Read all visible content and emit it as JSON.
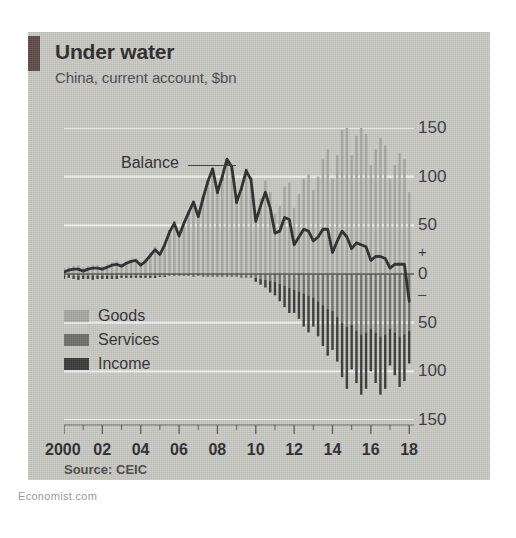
{
  "page": {
    "watermark": "Economist.com"
  },
  "header": {
    "title": "Under water",
    "subtitle": "China, current account, $bn",
    "accent_color": "#5e4a48"
  },
  "source": {
    "label": "Source: CEIC"
  },
  "annotation": {
    "balance_label": "Balance"
  },
  "legend": {
    "items": [
      {
        "label": "Goods",
        "color": "#a6a6a2"
      },
      {
        "label": "Services",
        "color": "#6e6e6a"
      },
      {
        "label": "Income",
        "color": "#3a3a38"
      }
    ]
  },
  "axis": {
    "y_ticks": [
      "150",
      "100",
      "50",
      "0",
      "50",
      "100",
      "150"
    ],
    "y_sign_plus": "+",
    "y_sign_minus": "–",
    "x_ticks": [
      "2000",
      "02",
      "04",
      "06",
      "08",
      "10",
      "12",
      "14",
      "16",
      "18"
    ]
  },
  "chart_data": {
    "type": "bar",
    "title": "Under water",
    "subtitle": "China, current account, $bn",
    "xlabel": "",
    "ylabel": "$bn",
    "ylim": [
      -150,
      150
    ],
    "xlim": [
      2000,
      2018.25
    ],
    "grid": true,
    "gridlines": [
      150,
      100,
      50,
      -50,
      -100,
      -150
    ],
    "legend_position": "inside-bottom-left",
    "source": "CEIC",
    "x_tick_labels": [
      "2000",
      "02",
      "04",
      "06",
      "08",
      "10",
      "12",
      "14",
      "16",
      "18"
    ],
    "x_tick_values": [
      2000,
      2002,
      2004,
      2006,
      2008,
      2010,
      2012,
      2014,
      2016,
      2018
    ],
    "y_tick_labels": [
      "150",
      "100",
      "50",
      "0",
      "-50",
      "-100",
      "-150"
    ],
    "y_tick_values": [
      150,
      100,
      50,
      0,
      -50,
      -100,
      -150
    ],
    "frequency": "quarterly",
    "x": [
      2000.0,
      2000.25,
      2000.5,
      2000.75,
      2001.0,
      2001.25,
      2001.5,
      2001.75,
      2002.0,
      2002.25,
      2002.5,
      2002.75,
      2003.0,
      2003.25,
      2003.5,
      2003.75,
      2004.0,
      2004.25,
      2004.5,
      2004.75,
      2005.0,
      2005.25,
      2005.5,
      2005.75,
      2006.0,
      2006.25,
      2006.5,
      2006.75,
      2007.0,
      2007.25,
      2007.5,
      2007.75,
      2008.0,
      2008.25,
      2008.5,
      2008.75,
      2009.0,
      2009.25,
      2009.5,
      2009.75,
      2010.0,
      2010.25,
      2010.5,
      2010.75,
      2011.0,
      2011.25,
      2011.5,
      2011.75,
      2012.0,
      2012.25,
      2012.5,
      2012.75,
      2013.0,
      2013.25,
      2013.5,
      2013.75,
      2014.0,
      2014.25,
      2014.5,
      2014.75,
      2015.0,
      2015.25,
      2015.5,
      2015.75,
      2016.0,
      2016.25,
      2016.5,
      2016.75,
      2017.0,
      2017.25,
      2017.5,
      2017.75,
      2018.0
    ],
    "series": [
      {
        "name": "Goods",
        "color": "#a6a6a2",
        "type": "bar",
        "values": [
          6,
          7,
          8,
          9,
          7,
          8,
          9,
          9,
          8,
          10,
          12,
          13,
          11,
          13,
          15,
          16,
          12,
          16,
          22,
          28,
          22,
          32,
          45,
          53,
          40,
          52,
          62,
          72,
          58,
          76,
          92,
          104,
          82,
          96,
          112,
          106,
          72,
          86,
          104,
          96,
          60,
          78,
          96,
          84,
          62,
          70,
          90,
          94,
          68,
          82,
          98,
          102,
          86,
          100,
          118,
          128,
          98,
          122,
          148,
          154,
          122,
          142,
          152,
          144,
          112,
          128,
          140,
          132,
          98,
          112,
          124,
          118,
          84
        ]
      },
      {
        "name": "Services",
        "color": "#6e6e6a",
        "type": "bar",
        "values": [
          -1,
          -1,
          -2,
          -2,
          -2,
          -2,
          -2,
          -2,
          -2,
          -2,
          -2,
          -2,
          -2,
          -2,
          -2,
          -2,
          -2,
          -2,
          -2,
          -2,
          -2,
          -2,
          -2,
          -2,
          -2,
          -2,
          -2,
          -3,
          -2,
          -3,
          -3,
          -3,
          -3,
          -3,
          -3,
          -3,
          -3,
          -4,
          -4,
          -4,
          -4,
          -5,
          -6,
          -7,
          -8,
          -10,
          -12,
          -14,
          -16,
          -18,
          -20,
          -22,
          -24,
          -28,
          -32,
          -36,
          -38,
          -44,
          -50,
          -54,
          -52,
          -58,
          -62,
          -60,
          -56,
          -60,
          -64,
          -62,
          -56,
          -60,
          -64,
          -62,
          -58
        ]
      },
      {
        "name": "Income",
        "color": "#3a3a38",
        "type": "bar",
        "values": [
          -4,
          -3,
          -3,
          -4,
          -3,
          -3,
          -4,
          -3,
          -3,
          -3,
          -3,
          -3,
          -2,
          -2,
          -2,
          -2,
          -2,
          -2,
          -2,
          -2,
          -1,
          -1,
          0,
          1,
          0,
          1,
          2,
          3,
          2,
          3,
          4,
          5,
          3,
          5,
          6,
          4,
          2,
          3,
          4,
          3,
          -4,
          -6,
          -8,
          -12,
          -14,
          -18,
          -22,
          -26,
          -24,
          -28,
          -34,
          -38,
          -30,
          -36,
          -42,
          -48,
          -40,
          -46,
          -56,
          -64,
          -46,
          -54,
          -62,
          -58,
          -44,
          -52,
          -60,
          -56,
          -38,
          -44,
          -52,
          -48,
          -34
        ]
      },
      {
        "name": "Balance",
        "color": "#2b2b2b",
        "type": "line",
        "values": [
          2,
          4,
          5,
          5,
          3,
          5,
          6,
          6,
          5,
          7,
          9,
          10,
          8,
          11,
          13,
          14,
          9,
          13,
          19,
          25,
          20,
          30,
          43,
          52,
          39,
          52,
          63,
          74,
          59,
          78,
          95,
          108,
          84,
          100,
          118,
          110,
          74,
          88,
          106,
          97,
          54,
          70,
          84,
          68,
          42,
          44,
          58,
          56,
          30,
          38,
          46,
          44,
          34,
          38,
          46,
          46,
          22,
          34,
          44,
          38,
          26,
          32,
          30,
          28,
          14,
          18,
          18,
          16,
          6,
          10,
          10,
          10,
          -28
        ]
      }
    ]
  }
}
